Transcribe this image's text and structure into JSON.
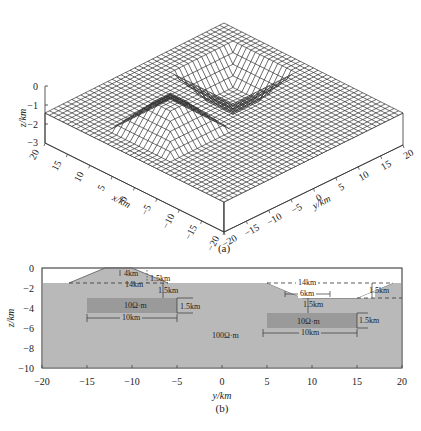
{
  "chart_data": [
    {
      "panel": "(a)",
      "type": "surface3d",
      "title": "",
      "xlabel": "x/km",
      "ylabel": "y/km",
      "zlabel": "z/km",
      "x_ticks": [
        "20",
        "15",
        "10",
        "5",
        "0",
        "-5",
        "-10",
        "-15",
        "-20"
      ],
      "y_ticks": [
        "-20",
        "-15",
        "-10",
        "-5",
        "0",
        "5",
        "10",
        "15",
        "20"
      ],
      "z_ticks": [
        "0",
        "-1",
        "-2",
        "-3"
      ],
      "xlim": [
        -20,
        20
      ],
      "ylim": [
        -20,
        20
      ],
      "zlim": [
        -3,
        0
      ],
      "surface": {
        "base_level_km": -1.5,
        "features": [
          {
            "name": "hill",
            "center_y": -10,
            "top_width_km": 4,
            "base_width_km": 14,
            "height_km": 1.5,
            "top_z": 0
          },
          {
            "name": "valley",
            "center_y": 10,
            "bottom_width_km": 6,
            "top_width_km": 14,
            "depth_km": 1.5,
            "bottom_z": -3
          }
        ]
      }
    },
    {
      "panel": "(b)",
      "type": "cross_section",
      "xlabel": "y/km",
      "ylabel": "z/km",
      "x_ticks": [
        "-20",
        "-15",
        "-10",
        "-5",
        "0",
        "5",
        "10",
        "15",
        "20"
      ],
      "y_ticks": [
        "0",
        "-2",
        "-4",
        "-6",
        "-8",
        "-10"
      ],
      "xlim": [
        -20,
        20
      ],
      "ylim": [
        -10,
        0
      ],
      "background_resistivity": "100Ω·m",
      "blocks": [
        {
          "label": "10Ω·m",
          "y_range": [
            -15,
            -5
          ],
          "z_range": [
            -4.5,
            -3
          ],
          "width_label": "10km",
          "thickness_label": "1.5km",
          "depth_label": "1.5km"
        },
        {
          "label": "10Ω·m",
          "y_range": [
            5,
            15
          ],
          "z_range": [
            -6,
            -4.5
          ],
          "width_label": "10km",
          "thickness_label": "1.5km",
          "depth_label": "1.5km"
        }
      ],
      "topography": [
        {
          "type": "hill",
          "top_label": "4km",
          "base_label": "14km",
          "height_label": "1.5km",
          "y_base": [
            -17,
            -3
          ],
          "y_top": [
            -12,
            -8
          ]
        },
        {
          "type": "valley",
          "top_label": "14km",
          "bottom_label": "6km",
          "depth_label": "1.5km",
          "y_top": [
            3,
            17
          ],
          "y_bottom": [
            7,
            13
          ]
        }
      ],
      "annotations": [
        "4km",
        "1.5km",
        "14km",
        "1.5km",
        "10Ω·m",
        "1.5km",
        "10km",
        "100Ω·m",
        "14km",
        "6km",
        "1.5km",
        "1.5km",
        "10Ω·m",
        "1.5km",
        "10km"
      ]
    }
  ],
  "labels": {
    "panel_a_caption": "(a)",
    "panel_b_caption": "(b)",
    "a_zlabel": "z/km",
    "a_xlabel": "x/km",
    "a_ylabel": "y/km",
    "b_xlabel": "y/km",
    "b_ylabel": "z/km",
    "a_z": [
      "0",
      "-1",
      "-2",
      "-3"
    ],
    "a_x": [
      "20",
      "15",
      "10",
      "5",
      "0",
      "-5",
      "-10",
      "-15",
      "-20"
    ],
    "a_y": [
      "-20",
      "-15",
      "-10",
      "-5",
      "0",
      "5",
      "10",
      "15",
      "20"
    ],
    "b_x": [
      "-20",
      "-15",
      "-10",
      "-5",
      "0",
      "5",
      "10",
      "15",
      "20"
    ],
    "b_y": [
      "0",
      "-2",
      "-4",
      "-6",
      "-8",
      "-10"
    ],
    "ann": {
      "hill_top": "4km",
      "hill_height": "1.5km",
      "hill_base": "14km",
      "left_depth": "1.5km",
      "left_block": "10Ω·m",
      "left_thick": "1.5km",
      "left_width": "10km",
      "bg": "100Ω·m",
      "valley_top": "14km",
      "valley_bottom": "6km",
      "valley_depth": "1.5km",
      "right_depth": "1.5km",
      "right_block": "10Ω·m",
      "right_thick": "1.5km",
      "right_width": "10km"
    }
  },
  "colors": {
    "background": "#ffffff",
    "mesh_line": "#2b2b2b",
    "medium": "#b9b9b9",
    "block": "#9a9a9a",
    "axis": "#333333"
  }
}
